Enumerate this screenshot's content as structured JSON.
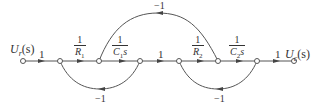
{
  "diagram": {
    "type": "signal-flow-graph",
    "input_label": "U_r(s)",
    "input_label_main": "U",
    "input_label_sub": "r",
    "input_label_arg": "(s)",
    "output_label_main": "U",
    "output_label_sub": "c",
    "output_label_arg": "(s)",
    "forward_gains": [
      {
        "id": "g1",
        "text": "1"
      },
      {
        "id": "g2",
        "num": "1",
        "den_main": "R",
        "den_sub": "1"
      },
      {
        "id": "g3",
        "num": "1",
        "den_main": "C",
        "den_sub": "1",
        "den_tail": "s"
      },
      {
        "id": "g4",
        "text": "1"
      },
      {
        "id": "g5",
        "num": "1",
        "den_main": "R",
        "den_sub": "2"
      },
      {
        "id": "g6",
        "num": "1",
        "den_main": "C",
        "den_sub": "2",
        "den_tail": "s"
      },
      {
        "id": "g7",
        "text": "1"
      }
    ],
    "feedback_gains": [
      {
        "id": "fb_top",
        "text": "-1",
        "from_node": 6,
        "to_node": 3
      },
      {
        "id": "fb_left",
        "text": "-1",
        "from_node": 4,
        "to_node": 2
      },
      {
        "id": "fb_right",
        "text": "-1",
        "from_node": 7,
        "to_node": 5
      }
    ],
    "node_count": 8,
    "colors": {
      "line": "#555555",
      "text": "#333333",
      "background": "#ffffff"
    }
  }
}
